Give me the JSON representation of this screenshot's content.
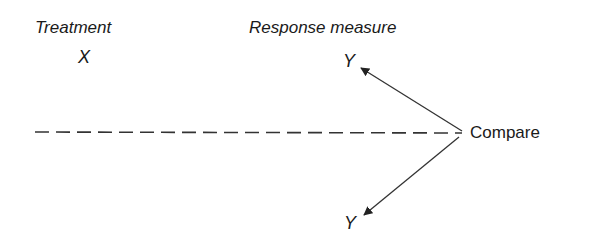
{
  "diagram": {
    "column_headers": {
      "treatment": "Treatment",
      "response": "Response measure"
    },
    "nodes": {
      "treatment_symbol": "X",
      "response_top": "Y",
      "response_bottom": "Y",
      "compare": "Compare"
    },
    "edges": [
      {
        "from": "Compare",
        "to": "Y (top)",
        "style": "solid-arrow"
      },
      {
        "from": "Compare",
        "to": "Y (bottom)",
        "style": "solid-arrow"
      },
      {
        "from": "left margin",
        "to": "Compare",
        "style": "dashed-line"
      }
    ],
    "colors": {
      "text": "#1a1a1a",
      "line": "#333333",
      "background": "#ffffff"
    }
  }
}
